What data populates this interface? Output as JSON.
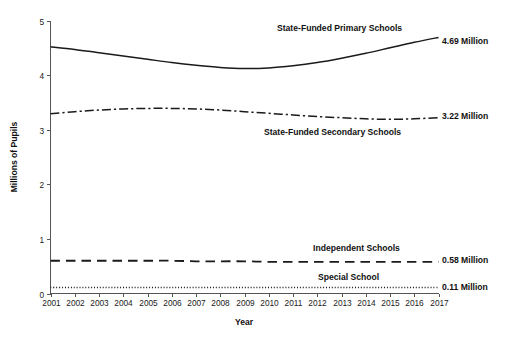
{
  "chart_data": {
    "type": "line",
    "title": "",
    "xlabel": "Year",
    "ylabel": "Millions of Pupils",
    "xlim": [
      2001,
      2017
    ],
    "ylim": [
      0,
      5
    ],
    "yticks": [
      "0",
      "1",
      "2",
      "3",
      "4",
      "5"
    ],
    "grid": false,
    "legend_position": "inline-annotations",
    "x": [
      2001,
      2002,
      2003,
      2004,
      2005,
      2006,
      2007,
      2008,
      2009,
      2010,
      2011,
      2012,
      2013,
      2014,
      2015,
      2016,
      2017
    ],
    "categories": [
      "2001",
      "2002",
      "2003",
      "2004",
      "2005",
      "2006",
      "2007",
      "2008",
      "2009",
      "2010",
      "2011",
      "2012",
      "2013",
      "2014",
      "2015",
      "2016",
      "2017"
    ],
    "series": [
      {
        "name": "State-Funded Primary Schools",
        "style": "solid",
        "color": "#1a1a1a",
        "end_value_label": "4.69 Million",
        "values": [
          4.52,
          4.47,
          4.41,
          4.35,
          4.29,
          4.23,
          4.18,
          4.14,
          4.12,
          4.13,
          4.17,
          4.23,
          4.31,
          4.4,
          4.5,
          4.6,
          4.69
        ]
      },
      {
        "name": "State-Funded Secondary Schools",
        "style": "dash-dot",
        "color": "#1a1a1a",
        "end_value_label": "3.22 Million",
        "values": [
          3.29,
          3.33,
          3.36,
          3.38,
          3.39,
          3.39,
          3.38,
          3.36,
          3.33,
          3.3,
          3.27,
          3.24,
          3.22,
          3.2,
          3.19,
          3.2,
          3.22
        ]
      },
      {
        "name": "Independent Schools",
        "style": "long-dash",
        "color": "#1a1a1a",
        "end_value_label": "0.58 Million",
        "values": [
          0.6,
          0.6,
          0.6,
          0.6,
          0.6,
          0.6,
          0.59,
          0.59,
          0.59,
          0.58,
          0.58,
          0.58,
          0.58,
          0.58,
          0.58,
          0.58,
          0.58
        ]
      },
      {
        "name": "Special School",
        "style": "dotted",
        "color": "#1a1a1a",
        "end_value_label": "0.11 Million",
        "values": [
          0.11,
          0.11,
          0.11,
          0.11,
          0.11,
          0.11,
          0.11,
          0.11,
          0.11,
          0.11,
          0.11,
          0.11,
          0.11,
          0.11,
          0.11,
          0.11,
          0.11
        ]
      }
    ]
  },
  "axes": {
    "y_title": "Millions of Pupils",
    "x_title": "Year",
    "y_tick_labels": [
      "5",
      "4",
      "3",
      "2",
      "1",
      "0"
    ],
    "x_tick_labels": [
      "2001",
      "2002",
      "2003",
      "2004",
      "2005",
      "2006",
      "2007",
      "2008",
      "2009",
      "2010",
      "2011",
      "2012",
      "2013",
      "2014",
      "2015",
      "2016",
      "2017"
    ]
  },
  "annotations": {
    "primary_name": "State-Funded Primary Schools",
    "primary_value": "4.69 Million",
    "secondary_name": "State-Funded Secondary Schools",
    "secondary_value": "3.22 Million",
    "independent_name": "Independent Schools",
    "independent_value": "0.58 Million",
    "special_name": "Special School",
    "special_value": "0.11 Million"
  }
}
